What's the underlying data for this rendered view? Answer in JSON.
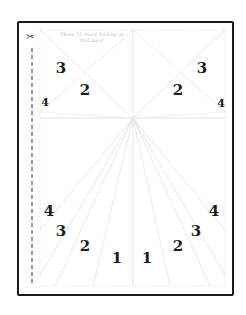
{
  "sheet": {
    "instruction_line1": "Photo 11 more folding as",
    "instruction_line2": "fold layer",
    "scissors_icon": "✂",
    "border_color": "#1a1a1a",
    "guide_line_color": "#dddddd"
  },
  "labels": {
    "top_left_3": "3",
    "top_left_2": "2",
    "top_left_4": "4",
    "top_right_3": "3",
    "top_right_2": "2",
    "top_right_4": "4",
    "bottom_left_4": "4",
    "bottom_left_3": "3",
    "bottom_left_2": "2",
    "bottom_left_1": "1",
    "bottom_right_1": "1",
    "bottom_right_2": "2",
    "bottom_right_3": "3",
    "bottom_right_4": "4"
  }
}
